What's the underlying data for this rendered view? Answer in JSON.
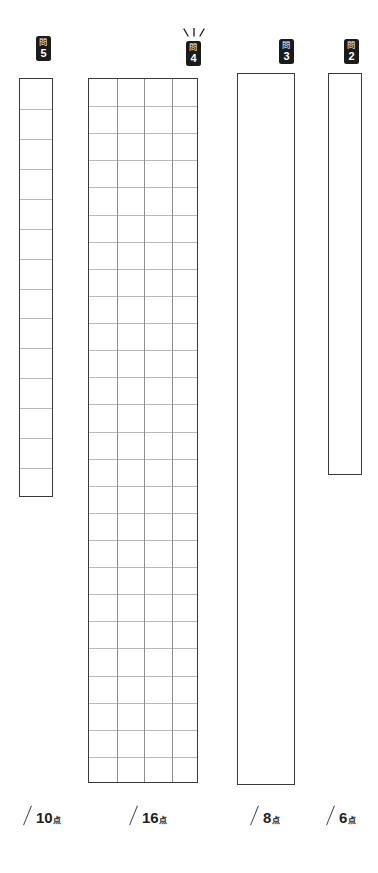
{
  "sheet": {
    "title": "Japanese exam answer sheet",
    "background_color": "#ffffff",
    "border_color": "#3a3a3a",
    "grid_line_color": "#b9b9b9",
    "badge_color": "#1b1b1b"
  },
  "questions": [
    {
      "id": "q5",
      "badge_kanji": "問",
      "badge_number": "5",
      "box_type": "ruled-single-column",
      "columns": 1,
      "rows": 14,
      "highlighted": false
    },
    {
      "id": "q4",
      "badge_kanji": "問",
      "badge_number": "4",
      "box_type": "grid",
      "columns": 4,
      "rows": 26,
      "highlighted": true
    },
    {
      "id": "q3",
      "badge_kanji": "問",
      "badge_number": "3",
      "box_type": "blank",
      "columns": 0,
      "rows": 0,
      "highlighted": false
    },
    {
      "id": "q2",
      "badge_kanji": "問",
      "badge_number": "2",
      "box_type": "blank",
      "columns": 0,
      "rows": 0,
      "highlighted": false
    }
  ],
  "scores": [
    {
      "id": "score5",
      "slash": "/",
      "points": "10",
      "unit": "点"
    },
    {
      "id": "score4",
      "slash": "/",
      "points": "16",
      "unit": "点"
    },
    {
      "id": "score3",
      "slash": "/",
      "points": "8",
      "unit": "点"
    },
    {
      "id": "score2",
      "slash": "/",
      "points": "6",
      "unit": "点"
    }
  ]
}
